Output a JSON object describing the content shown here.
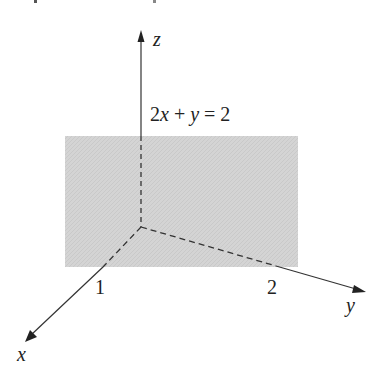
{
  "diagram": {
    "type": "3d-coordinate-plane",
    "axes": {
      "x": {
        "label": "x",
        "tick_label": "1"
      },
      "y": {
        "label": "y",
        "tick_label": "2"
      },
      "z": {
        "label": "z"
      }
    },
    "plane": {
      "equation_label": "2x + y = 2",
      "equation_parts": {
        "c1": "2",
        "v1": "x",
        "op": " + ",
        "v2": "y",
        "eq": " = ",
        "rhs": "2"
      },
      "fill_color": "#d2d2d2"
    },
    "colors": {
      "axis": "#333333",
      "text": "#222222",
      "background": "#ffffff"
    }
  }
}
